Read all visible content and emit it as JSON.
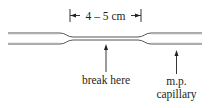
{
  "diagram": {
    "dimension_label": "4 – 5 cm",
    "labels": {
      "break_here": "break here",
      "mp_line1": "m.p.",
      "mp_line2": "capillary"
    },
    "colors": {
      "line": "#231f20",
      "tube": "#555555",
      "background": "#ffffff"
    }
  }
}
